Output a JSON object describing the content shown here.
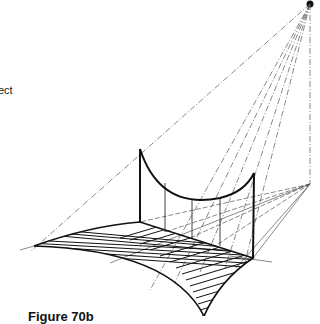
{
  "figure": {
    "caption": "Figure 70b",
    "side_text_fragment": "ect",
    "colors": {
      "ink": "#1a1a1a",
      "construction_line": "#555555",
      "background": "#ffffff"
    }
  }
}
